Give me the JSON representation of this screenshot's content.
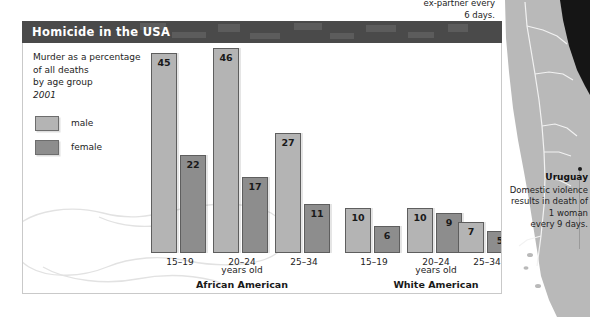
{
  "panel": {
    "title": "Homicide in the USA",
    "caption_lines": [
      "Murder as a percentage",
      "of all deaths",
      "by age group"
    ],
    "year": "2001"
  },
  "legend": {
    "items": [
      {
        "key": "male",
        "label": "male",
        "color": "#b4b4b4"
      },
      {
        "key": "female",
        "label": "female",
        "color": "#8d8d8d"
      }
    ]
  },
  "annotations": {
    "top_note_lines": [
      "ex-partner every",
      "6 days."
    ],
    "uruguay": {
      "name": "Uruguay",
      "lines": [
        "Domestic violence",
        "results in death of",
        "1 woman",
        "every 9 days."
      ]
    }
  },
  "chart_data": {
    "type": "bar",
    "title": "Homicide in the USA",
    "subtitle": "Murder as a percentage of all deaths by age group",
    "year": "2001",
    "xlabel": "years old",
    "ylabel": "percentage of all deaths",
    "ylim": [
      0,
      46
    ],
    "grid": false,
    "legend_position": "top-left",
    "groups": [
      "African American",
      "White American"
    ],
    "categories": [
      "15–19",
      "20–24",
      "25–34"
    ],
    "axis_note": "years old",
    "series": [
      {
        "name": "male",
        "color": "#b4b4b4",
        "values_by_group": {
          "African American": [
            45,
            46,
            27
          ],
          "White American": [
            10,
            10,
            7
          ]
        }
      },
      {
        "name": "female",
        "color": "#8d8d8d",
        "values_by_group": {
          "African American": [
            22,
            17,
            11
          ],
          "White American": [
            6,
            9,
            5
          ]
        }
      }
    ],
    "bars": [
      {
        "group": "African American",
        "category": "15–19",
        "series": "male",
        "value": 45
      },
      {
        "group": "African American",
        "category": "15–19",
        "series": "female",
        "value": 22
      },
      {
        "group": "African American",
        "category": "20–24",
        "series": "male",
        "value": 46
      },
      {
        "group": "African American",
        "category": "20–24",
        "series": "female",
        "value": 17
      },
      {
        "group": "African American",
        "category": "25–34",
        "series": "male",
        "value": 27
      },
      {
        "group": "African American",
        "category": "25–34",
        "series": "female",
        "value": 11
      },
      {
        "group": "White American",
        "category": "15–19",
        "series": "male",
        "value": 10
      },
      {
        "group": "White American",
        "category": "15–19",
        "series": "female",
        "value": 6
      },
      {
        "group": "White American",
        "category": "20–24",
        "series": "male",
        "value": 10
      },
      {
        "group": "White American",
        "category": "20–24",
        "series": "female",
        "value": 9
      },
      {
        "group": "White American",
        "category": "25–34",
        "series": "male",
        "value": 7
      },
      {
        "group": "White American",
        "category": "25–34",
        "series": "female",
        "value": 5
      }
    ]
  },
  "layout": {
    "baseline_y": 232,
    "px_per_unit": 4.45,
    "bar_width": 26,
    "pair_gap": 3,
    "group_positions": [
      {
        "group": "African American",
        "category": "15–19",
        "x": 128,
        "label_center": 157
      },
      {
        "group": "African American",
        "category": "20–24",
        "x": 190,
        "label_center": 219
      },
      {
        "group": "African American",
        "category": "25–34",
        "x": 252,
        "label_center": 281
      },
      {
        "group": "White American",
        "category": "15–19",
        "x": 322,
        "label_center": 351
      },
      {
        "group": "White American",
        "category": "20–24",
        "x": 384,
        "label_center": 413
      },
      {
        "group": "White American",
        "category": "25–34",
        "x": 435,
        "label_center": 464
      }
    ],
    "group_label_positions": [
      {
        "label": "African American",
        "center": 219,
        "y": 258
      },
      {
        "label": "White American",
        "center": 413,
        "y": 258
      }
    ],
    "axis_note_positions": [
      {
        "center": 219,
        "y": 244
      },
      {
        "center": 413,
        "y": 244
      }
    ]
  }
}
